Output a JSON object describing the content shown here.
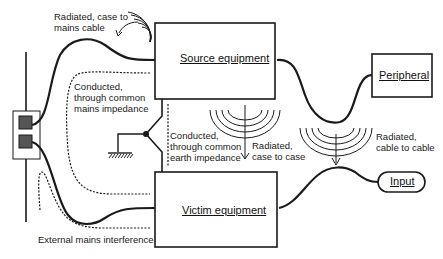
{
  "diagram": {
    "nodes": {
      "source": {
        "label": "Source equipment"
      },
      "victim": {
        "label": "Victim equipment"
      },
      "peripheral": {
        "label": "Peripheral"
      },
      "input": {
        "label": "Input"
      },
      "mains_outlet": {
        "label": ""
      }
    },
    "annotations": {
      "radiated_case_to_mains": "Radiated, case to\nmains cable",
      "conducted_mains": "Conducted,\nthrough common\nmains impedance",
      "conducted_earth": "Conducted,\nthrough common\nearth impedance",
      "radiated_case_to_case": "Radiated,\ncase to case",
      "radiated_cable_to_cable": "Radiated,\ncable to cable",
      "external_mains": "External mains interference"
    },
    "colors": {
      "line": "#1a1a1a",
      "background": "#ffffff",
      "socket_fill": "#555555"
    }
  }
}
